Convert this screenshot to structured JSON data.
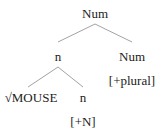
{
  "tree": {
    "root": {
      "label": "Num"
    },
    "left": {
      "label": "n"
    },
    "right": {
      "label": "Num",
      "feature": "[+plural]"
    },
    "left_left": {
      "root_symbol": "√",
      "label": "MOUSE"
    },
    "left_right": {
      "label": "n",
      "feature": "[+N]"
    }
  },
  "colors": {
    "line": "#8a8a8a",
    "text": "#222222"
  }
}
